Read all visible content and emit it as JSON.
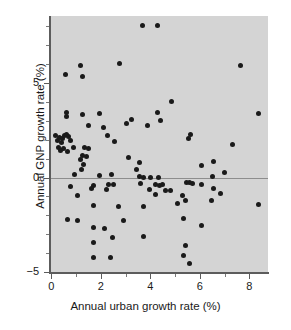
{
  "chart_data": {
    "type": "scatter",
    "title": "",
    "xlabel": "Annual urban growth rate (%)",
    "ylabel": "Annual GNP growth rate (%)",
    "xlim": [
      -0.05,
      8.75
    ],
    "ylim": [
      -5,
      8.55
    ],
    "xticks": [
      0,
      2,
      4,
      6,
      8
    ],
    "xtick_labels": [
      "0",
      "2",
      "4",
      "6",
      "8"
    ],
    "yticks": [
      -5,
      0,
      5
    ],
    "ytick_labels": [
      "−5",
      "0",
      "5"
    ],
    "x_minor_ticks": [
      1,
      3,
      5,
      7
    ],
    "y_minor_ticks": [
      -4,
      -3,
      -2,
      -1,
      1,
      2,
      3,
      4,
      6,
      7,
      8
    ],
    "grid": false,
    "legend": null,
    "zero_line": 0,
    "marker": "filled-circle",
    "marker_color": "#1a1a1a",
    "panel_color": "#d4d4d4",
    "axis_color": "#5c5c5c",
    "points": [
      [
        3.68,
        8.05
      ],
      [
        4.3,
        8.05
      ],
      [
        2.74,
        6.05
      ],
      [
        1.17,
        5.95
      ],
      [
        7.62,
        5.95
      ],
      [
        0.58,
        5.45
      ],
      [
        1.27,
        5.35
      ],
      [
        4.87,
        4.05
      ],
      [
        0.62,
        3.45
      ],
      [
        1.25,
        3.35
      ],
      [
        1.95,
        3.4
      ],
      [
        4.27,
        3.45
      ],
      [
        8.38,
        3.4
      ],
      [
        0.63,
        3.25
      ],
      [
        3.22,
        3.05
      ],
      [
        4.4,
        3.0
      ],
      [
        3.05,
        2.85
      ],
      [
        1.5,
        2.75
      ],
      [
        2.1,
        2.65
      ],
      [
        3.88,
        2.75
      ],
      [
        0.18,
        2.25
      ],
      [
        0.33,
        2.1
      ],
      [
        0.45,
        2.05
      ],
      [
        0.52,
        2.2
      ],
      [
        0.62,
        2.3
      ],
      [
        0.7,
        2.15
      ],
      [
        2.28,
        2.25
      ],
      [
        5.62,
        2.3
      ],
      [
        5.55,
        2.05
      ],
      [
        0.25,
        1.95
      ],
      [
        0.4,
        1.85
      ],
      [
        0.78,
        1.95
      ],
      [
        2.55,
        1.9
      ],
      [
        0.3,
        1.6
      ],
      [
        0.48,
        1.55
      ],
      [
        0.88,
        1.6
      ],
      [
        1.35,
        1.6
      ],
      [
        1.52,
        1.55
      ],
      [
        0.38,
        1.45
      ],
      [
        0.65,
        1.4
      ],
      [
        7.3,
        1.75
      ],
      [
        1.28,
        1.15
      ],
      [
        1.42,
        1.1
      ],
      [
        3.12,
        1.05
      ],
      [
        1.18,
        0.95
      ],
      [
        3.55,
        0.8
      ],
      [
        6.55,
        0.85
      ],
      [
        1.32,
        0.7
      ],
      [
        6.05,
        0.65
      ],
      [
        1.22,
        0.45
      ],
      [
        3.45,
        0.4
      ],
      [
        6.98,
        0.25
      ],
      [
        0.95,
        0.15
      ],
      [
        1.93,
        0.12
      ],
      [
        2.42,
        0.18
      ],
      [
        3.58,
        0.05
      ],
      [
        3.72,
        0.0
      ],
      [
        4.02,
        0.02
      ],
      [
        4.32,
        0.02
      ],
      [
        6.5,
        0.05
      ],
      [
        0.78,
        -0.45
      ],
      [
        1.72,
        -0.4
      ],
      [
        2.3,
        -0.35
      ],
      [
        2.5,
        -0.35
      ],
      [
        3.62,
        -0.3
      ],
      [
        4.22,
        -0.35
      ],
      [
        4.35,
        -0.4
      ],
      [
        4.48,
        -0.35
      ],
      [
        5.45,
        -0.25
      ],
      [
        5.58,
        -0.28
      ],
      [
        5.72,
        -0.3
      ],
      [
        6.05,
        -0.35
      ],
      [
        1.62,
        -0.6
      ],
      [
        2.22,
        -0.65
      ],
      [
        3.95,
        -0.65
      ],
      [
        4.62,
        -0.7
      ],
      [
        4.82,
        -0.7
      ],
      [
        6.55,
        -0.6
      ],
      [
        1.08,
        -0.95
      ],
      [
        4.2,
        -0.9
      ],
      [
        5.28,
        -0.95
      ],
      [
        6.82,
        -0.85
      ],
      [
        2.72,
        -1.55
      ],
      [
        3.72,
        -1.55
      ],
      [
        5.42,
        -1.2
      ],
      [
        6.45,
        -1.2
      ],
      [
        1.72,
        -1.5
      ],
      [
        5.1,
        -1.35
      ],
      [
        8.35,
        -1.45
      ],
      [
        0.65,
        -2.2
      ],
      [
        1.08,
        -2.25
      ],
      [
        2.92,
        -2.25
      ],
      [
        5.35,
        -2.15
      ],
      [
        1.7,
        -2.65
      ],
      [
        2.15,
        -2.7
      ],
      [
        6.05,
        -2.55
      ],
      [
        2.48,
        -3.15
      ],
      [
        3.72,
        -3.1
      ],
      [
        1.7,
        -3.45
      ],
      [
        5.4,
        -3.6
      ],
      [
        1.72,
        -4.25
      ],
      [
        2.4,
        -4.25
      ],
      [
        5.35,
        -4.15
      ],
      [
        5.58,
        -4.55
      ]
    ]
  }
}
